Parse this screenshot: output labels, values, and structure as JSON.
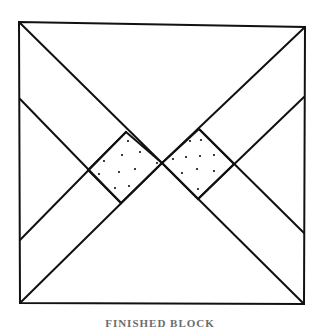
{
  "figure": {
    "caption": "FINISHED BLOCK",
    "stroke_color": "#111111",
    "dot_color": "#111111",
    "background": "#ffffff",
    "outer_square": {
      "corners": [
        [
          19,
          22
        ],
        [
          305,
          27
        ],
        [
          304,
          304
        ],
        [
          20,
          303
        ]
      ]
    },
    "lines": [
      {
        "name": "diagonal-top-left-to-center",
        "from": [
          19,
          22
        ],
        "to": [
          162,
          163
        ]
      },
      {
        "name": "diagonal-top-right-to-center",
        "from": [
          305,
          27
        ],
        "to": [
          162,
          163
        ]
      },
      {
        "name": "diagonal-bottom-left-to-center",
        "from": [
          20,
          303
        ],
        "to": [
          162,
          163
        ]
      },
      {
        "name": "diagonal-bottom-right-to-center",
        "from": [
          304,
          304
        ],
        "to": [
          162,
          163
        ]
      },
      {
        "name": "inner-line-left-upper",
        "from": [
          20,
          99
        ],
        "to": [
          121,
          203
        ]
      },
      {
        "name": "inner-line-left-lower",
        "from": [
          20,
          240
        ],
        "to": [
          126,
          132
        ]
      },
      {
        "name": "inner-line-right-upper",
        "from": [
          304,
          97
        ],
        "to": [
          198,
          199
        ]
      },
      {
        "name": "inner-line-right-lower",
        "from": [
          304,
          233
        ],
        "to": [
          199,
          129
        ]
      }
    ],
    "dotted_squares": [
      {
        "name": "left-dotted-square",
        "vertices": [
          [
            126,
            132
          ],
          [
            162,
            163
          ],
          [
            121,
            203
          ],
          [
            88,
            170
          ]
        ],
        "dots": [
          [
            128,
            141
          ],
          [
            140,
            152
          ],
          [
            122,
            155
          ],
          [
            104,
            161
          ],
          [
            157,
            163
          ],
          [
            99,
            174
          ],
          [
            119,
            172
          ],
          [
            135,
            169
          ],
          [
            115,
            188
          ],
          [
            129,
            186
          ]
        ]
      },
      {
        "name": "right-dotted-square",
        "vertices": [
          [
            199,
            129
          ],
          [
            234,
            164
          ],
          [
            198,
            199
          ],
          [
            162,
            163
          ]
        ],
        "dots": [
          [
            190,
            141
          ],
          [
            201,
            140
          ],
          [
            173,
            159
          ],
          [
            186,
            157
          ],
          [
            200,
            156
          ],
          [
            214,
            155
          ],
          [
            182,
            173
          ],
          [
            197,
            169
          ],
          [
            214,
            171
          ],
          [
            198,
            189
          ]
        ]
      }
    ]
  }
}
